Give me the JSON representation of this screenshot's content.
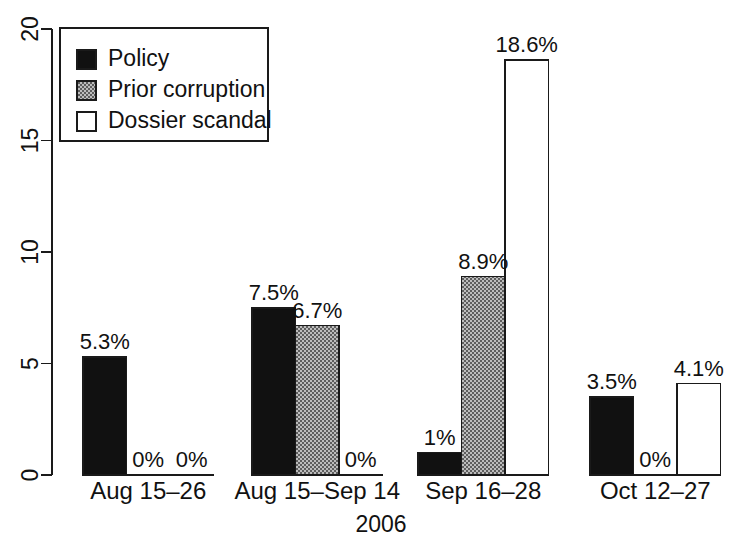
{
  "chart_data": {
    "type": "bar",
    "title": "",
    "subtitle": "",
    "xlabel": "2006",
    "ylabel": "",
    "categories": [
      "Aug 15–26",
      "Aug 15–Sep 14",
      "Sep 16–28",
      "Oct 12–27"
    ],
    "series": [
      {
        "name": "Policy",
        "color": "#111111",
        "fill": "solid-black",
        "values": [
          5.3,
          7.5,
          1.0,
          3.5
        ],
        "labels": [
          "5.3%",
          "7.5%",
          "1%",
          "3.5%"
        ]
      },
      {
        "name": "Prior corruption",
        "color": "#8a8a8a",
        "fill": "dither-gray",
        "values": [
          0,
          6.7,
          8.9,
          0
        ],
        "labels": [
          "0%",
          "6.7%",
          "8.9%",
          "0%"
        ]
      },
      {
        "name": "Dossier scandal",
        "color": "#ffffff",
        "fill": "solid-white",
        "values": [
          0,
          0,
          18.6,
          4.1
        ],
        "labels": [
          "0%",
          "0%",
          "18.6%",
          "4.1%"
        ]
      }
    ],
    "yticks": [
      0,
      5,
      10,
      15,
      20
    ],
    "ytick_labels": [
      "0",
      "5",
      "10",
      "15",
      "20"
    ],
    "ylim": [
      0,
      20
    ],
    "grid": false,
    "legend": {
      "position": "top-left-inside",
      "entries": [
        "Policy",
        "Prior corruption",
        "Dossier scandal"
      ]
    },
    "axis_color": "#111111",
    "background": "#ffffff"
  }
}
